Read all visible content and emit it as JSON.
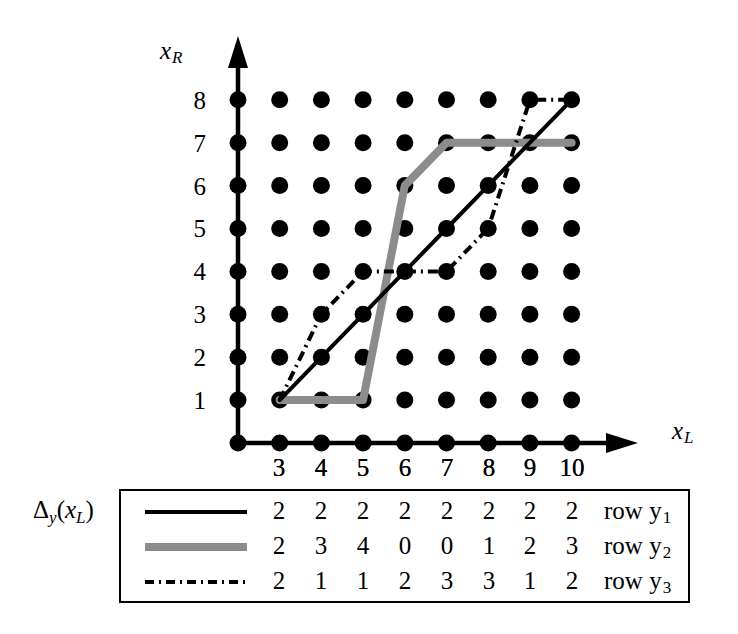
{
  "axes": {
    "y_label": "x",
    "y_label_sub": "R",
    "x_label": "x",
    "x_label_sub": "L",
    "y_ticks": [
      "8",
      "7",
      "6",
      "5",
      "4",
      "3",
      "2",
      "1"
    ],
    "x_ticks": [
      "3",
      "4",
      "5",
      "6",
      "7",
      "8",
      "9",
      "10"
    ]
  },
  "legend": {
    "delta_symbol": "Δ",
    "delta_sub": "y",
    "delta_arg_open": "(",
    "delta_arg": "x",
    "delta_arg_sub": "L",
    "delta_arg_close": ")",
    "column_headers": [
      "3",
      "4",
      "5",
      "6",
      "7",
      "8",
      "9",
      "10"
    ],
    "rows": [
      {
        "style": "solid-black",
        "values": [
          "2",
          "2",
          "2",
          "2",
          "2",
          "2",
          "2",
          "2"
        ],
        "label": "row y",
        "label_sub": "1"
      },
      {
        "style": "solid-gray",
        "values": [
          "2",
          "3",
          "4",
          "0",
          "0",
          "1",
          "2",
          "3"
        ],
        "label": "row y",
        "label_sub": "2"
      },
      {
        "style": "dash-dot",
        "values": [
          "2",
          "1",
          "1",
          "2",
          "3",
          "3",
          "1",
          "2"
        ],
        "label": "row y",
        "label_sub": "3"
      }
    ]
  },
  "colors": {
    "ink": "#000000",
    "gray_line": "#8c8c8c",
    "background": "#ffffff"
  },
  "chart_data": {
    "type": "line",
    "title": "",
    "xlabel": "x_L",
    "ylabel": "x_R",
    "grid": "dot-lattice",
    "xlim": [
      2,
      10
    ],
    "ylim": [
      0,
      8
    ],
    "x": [
      3,
      4,
      5,
      6,
      7,
      8,
      9,
      10
    ],
    "legend_position": "bottom-box",
    "series": [
      {
        "name": "row y1",
        "style": "solid-black",
        "deltas": [
          2,
          2,
          2,
          2,
          2,
          2,
          2,
          2
        ],
        "values": [
          1,
          2,
          3,
          4,
          5,
          6,
          7,
          8
        ]
      },
      {
        "name": "row y2",
        "style": "solid-gray",
        "deltas": [
          2,
          3,
          4,
          0,
          0,
          1,
          2,
          3
        ],
        "values": [
          1,
          1,
          1,
          6,
          7,
          7,
          7,
          7
        ]
      },
      {
        "name": "row y3",
        "style": "dash-dot",
        "deltas": [
          2,
          1,
          1,
          2,
          3,
          3,
          1,
          2
        ],
        "values": [
          1,
          3,
          4,
          4,
          4,
          5,
          8,
          8
        ]
      }
    ]
  }
}
